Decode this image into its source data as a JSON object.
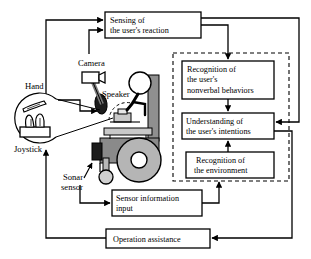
{
  "diagram": {
    "type": "block-flow-diagram",
    "colors": {
      "stroke": "#000000",
      "background": "#ffffff",
      "chair_body": "#8a8a8a",
      "chair_light": "#c9c9c9",
      "chair_mid": "#a8a8a8",
      "wheel_fill": "#b5b5b5",
      "dark_part": "#2b2b2b",
      "box_fill": "#ffffff"
    },
    "process_boxes": [
      {
        "id": "sensing",
        "lines": [
          "Sensing of",
          "the user's reaction"
        ],
        "x": 105,
        "y": 12,
        "w": 96,
        "h": 26
      },
      {
        "id": "recognition-nonverbal",
        "lines": [
          "Recognition of",
          "the user's",
          "nonverbal behaviors"
        ],
        "x": 182,
        "y": 61,
        "w": 92,
        "h": 38
      },
      {
        "id": "understanding-intentions",
        "lines": [
          "Understanding of",
          "the user's intentions"
        ],
        "x": 182,
        "y": 113,
        "w": 92,
        "h": 26
      },
      {
        "id": "recognition-environment",
        "lines": [
          "Recognition of",
          "the environment"
        ],
        "x": 186,
        "y": 152,
        "w": 88,
        "h": 26
      },
      {
        "id": "sensor-information-input",
        "lines": [
          "Sensor information",
          "input"
        ],
        "x": 112,
        "y": 190,
        "w": 90,
        "h": 26
      },
      {
        "id": "operation-assistance",
        "lines": [
          "Operation assistance"
        ],
        "x": 106,
        "y": 229,
        "w": 104,
        "h": 19
      }
    ],
    "dashed_group": {
      "id": "recognition-group",
      "x": 173,
      "y": 53,
      "w": 116,
      "h": 128
    },
    "part_labels": [
      {
        "id": "camera",
        "text": "Camera",
        "x": 78,
        "y": 66
      },
      {
        "id": "speaker",
        "text": "Speaker",
        "x": 102,
        "y": 97
      },
      {
        "id": "hand",
        "text": "Hand",
        "x": 25,
        "y": 89
      },
      {
        "id": "joystick",
        "text": "Joystick",
        "x": 14,
        "y": 152
      },
      {
        "id": "sonar-sensor-line1",
        "text": "Sonar",
        "x": 63,
        "y": 180
      },
      {
        "id": "sonar-sensor-line2",
        "text": "sensor",
        "x": 61,
        "y": 190
      }
    ],
    "illustration": {
      "name": "wheelchair-with-user",
      "parts": [
        "camera",
        "speaker",
        "joystick",
        "hand",
        "sonar-sensor",
        "seated-user",
        "wheel",
        "caster",
        "chair-frame"
      ]
    }
  }
}
